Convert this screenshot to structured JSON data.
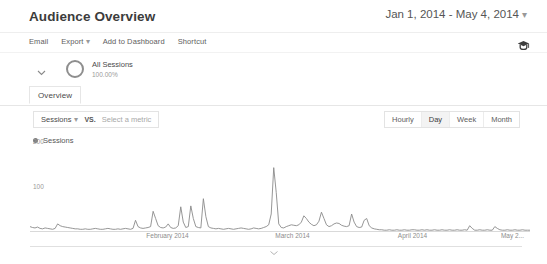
{
  "header": {
    "title": "Audience Overview",
    "date_range": "Jan 1, 2014 - May 4, 2014",
    "date_range_caret": "▾"
  },
  "toolbar": {
    "items": [
      {
        "label": "Email"
      },
      {
        "label": "Export",
        "caret": "▾"
      },
      {
        "label": "Add to Dashboard"
      },
      {
        "label": "Shortcut"
      }
    ],
    "right_icon": "graduation-cap-icon"
  },
  "segment": {
    "chevron_icon": "chevron-down-icon",
    "donut_icon": "segment-donut-icon",
    "name": "All Sessions",
    "percent": "100.00%"
  },
  "tabs": [
    {
      "label": "Overview",
      "active": true
    }
  ],
  "metric_selector": {
    "primary": "Sessions",
    "primary_caret": "▾",
    "vs_label": "VS.",
    "secondary_placeholder": "Select a metric"
  },
  "granularity": {
    "options": [
      "Hourly",
      "Day",
      "Week",
      "Month"
    ],
    "selected": "Day"
  },
  "chart_legend": {
    "series_label": "Sessions",
    "dot_color": "#7d7d7d"
  },
  "footer": {
    "collapse_icon": "chevron-down-icon"
  },
  "chart_data": {
    "type": "line",
    "title": "Sessions",
    "xlabel": "",
    "ylabel": "Sessions",
    "ylim": [
      0,
      200
    ],
    "y_ticks": [
      100,
      200
    ],
    "y_tick_labels": [
      "100",
      "200"
    ],
    "grid": false,
    "legend": [
      "Sessions"
    ],
    "legend_position": "top-left",
    "line_color": "#8a8a8a",
    "x_tick_labels": [
      "February 2014",
      "March 2014",
      "April 2014",
      "May 2..."
    ],
    "x_tick_positions_pct": [
      27.5,
      52.5,
      76.5,
      96.5
    ],
    "x_range": [
      "Jan 1, 2014",
      "May 4, 2014"
    ],
    "series": [
      {
        "name": "Sessions",
        "values": [
          12,
          10,
          9,
          11,
          8,
          7,
          9,
          8,
          7,
          6,
          8,
          18,
          14,
          12,
          11,
          10,
          9,
          8,
          7,
          7,
          6,
          6,
          7,
          6,
          6,
          7,
          8,
          7,
          6,
          6,
          7,
          8,
          7,
          6,
          6,
          7,
          6,
          7,
          8,
          7,
          6,
          8,
          26,
          12,
          9,
          8,
          9,
          10,
          12,
          46,
          30,
          14,
          10,
          9,
          11,
          18,
          10,
          8,
          9,
          14,
          56,
          22,
          10,
          12,
          58,
          30,
          12,
          10,
          9,
          74,
          34,
          12,
          9,
          8,
          7,
          8,
          7,
          6,
          7,
          8,
          7,
          6,
          7,
          8,
          9,
          8,
          7,
          6,
          7,
          9,
          8,
          7,
          8,
          10,
          12,
          16,
          40,
          143,
          88,
          18,
          10,
          9,
          12,
          14,
          16,
          15,
          14,
          16,
          22,
          36,
          30,
          22,
          17,
          14,
          16,
          24,
          44,
          30,
          16,
          12,
          14,
          18,
          20,
          19,
          15,
          13,
          12,
          14,
          40,
          22,
          12,
          10,
          11,
          26,
          30,
          14,
          9,
          7,
          6,
          5,
          5,
          4,
          4,
          5,
          4,
          4,
          5,
          4,
          4,
          5,
          4,
          4,
          5,
          5,
          4,
          4,
          5,
          4,
          5,
          4,
          4,
          5,
          4,
          4,
          5,
          4,
          4,
          5,
          4,
          4,
          5,
          4,
          4,
          5,
          4,
          14,
          8,
          4,
          4,
          5,
          4,
          4,
          5,
          4,
          4,
          12,
          8,
          5,
          4,
          4,
          5,
          4,
          4,
          5,
          4,
          4,
          5,
          4,
          4,
          4
        ]
      }
    ]
  }
}
